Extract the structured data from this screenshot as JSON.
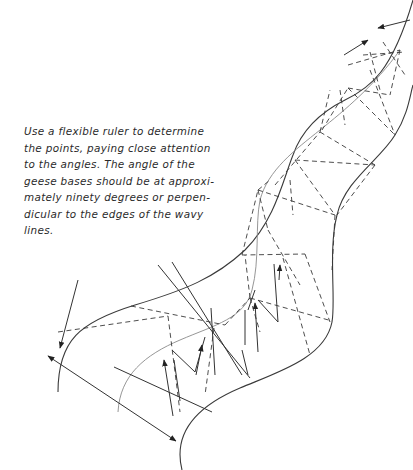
{
  "caption": {
    "lines": [
      "Use a flexible ruler to determine",
      "the points, paying close attention",
      "to the angles. The angle of the",
      "geese bases should be at approxi-",
      "mately ninety degrees or perpen-",
      "dicular to the edges of the wavy",
      "lines."
    ]
  },
  "diagram": {
    "elements": [
      "wavy-edge-left",
      "wavy-edge-right",
      "center-line",
      "dashed-triangles",
      "perpendicular-guides",
      "direction-arrows",
      "ruler-measure-arrow"
    ]
  }
}
